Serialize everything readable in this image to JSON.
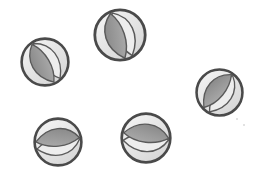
{
  "scene": {
    "title": "Grayscale bean icons",
    "width": 253,
    "height": 178,
    "background_color": "#ffffff",
    "object_count": 5,
    "object_name": "bean-icon"
  },
  "palette": {
    "ring_stroke": "#4a4a4a",
    "disc_fill_light": "#f2f2f2",
    "disc_fill_mid": "#e2e2e2",
    "disc_fill_shadow": "#d6d6d6",
    "lens_dark": "#848484",
    "lens_mid": "#a8a8a8",
    "lens_light": "#ededed",
    "lens_stroke": "#5a5a5a",
    "speck": "#d8d8d8"
  },
  "chart_data": {
    "type": "scatter",
    "xlabel": "",
    "ylabel": "",
    "xlim": [
      0,
      253
    ],
    "ylim": [
      0,
      178
    ],
    "grid": false,
    "legend": "none",
    "categories": [
      "bean-1",
      "bean-2",
      "bean-3",
      "bean-4",
      "bean-5"
    ],
    "values": [
      51,
      55,
      50,
      51,
      53
    ],
    "points": [
      {
        "label": "bean-1",
        "x": 45,
        "y": 62,
        "size": 51,
        "rotation": -32
      },
      {
        "label": "bean-2",
        "x": 120,
        "y": 35,
        "size": 55,
        "rotation": -20
      },
      {
        "label": "bean-3",
        "x": 220,
        "y": 92,
        "size": 50,
        "rotation": 38
      },
      {
        "label": "bean-4",
        "x": 58,
        "y": 141,
        "size": 51,
        "rotation": 82
      },
      {
        "label": "bean-5",
        "x": 146,
        "y": 138,
        "size": 53,
        "rotation": 95
      }
    ]
  },
  "objects": [
    {
      "name": "bean-1",
      "left": 19,
      "top": 36,
      "size": 52,
      "rotation": -32,
      "description": "top-left bean, lens tilted up-right"
    },
    {
      "name": "bean-2",
      "left": 92,
      "top": 7,
      "size": 56,
      "rotation": -20,
      "description": "top-center bean, largest, lens near vertical"
    },
    {
      "name": "bean-3",
      "left": 194,
      "top": 67,
      "size": 51,
      "rotation": 38,
      "description": "right bean, lens tilted down-right"
    },
    {
      "name": "bean-4",
      "left": 32,
      "top": 116,
      "size": 52,
      "rotation": 82,
      "description": "bottom-left bean, lens nearly horizontal"
    },
    {
      "name": "bean-5",
      "left": 119,
      "top": 111,
      "size": 54,
      "rotation": 95,
      "description": "bottom-center bean, lens horizontal"
    }
  ],
  "specks": [
    {
      "name": "speck-1",
      "left": 236,
      "top": 118,
      "size": 2
    },
    {
      "name": "speck-2",
      "left": 243,
      "top": 124,
      "size": 2
    }
  ]
}
